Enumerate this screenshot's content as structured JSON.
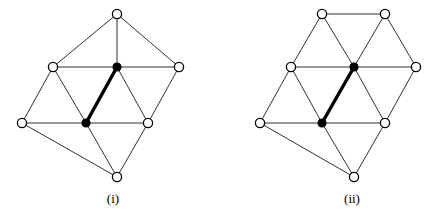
{
  "figure": {
    "title": "",
    "background_color": "#ffffff",
    "edge_color": "#1a1a1a",
    "bold_edge_color": "#000000",
    "vertex_open_fill": "#ffffff",
    "vertex_filled_fill": "#000000",
    "panels": [
      {
        "id": "panel-i",
        "caption": "(i)",
        "caption_x": 113,
        "caption_y": 203,
        "vertices": [
          {
            "id": "v-top",
            "x": 117,
            "y": 14,
            "type": "open"
          },
          {
            "id": "v-mid-left",
            "x": 53,
            "y": 67,
            "type": "open"
          },
          {
            "id": "v-mid-center",
            "x": 117,
            "y": 67,
            "type": "filled"
          },
          {
            "id": "v-mid-right",
            "x": 179,
            "y": 67,
            "type": "open"
          },
          {
            "id": "v-low-left",
            "x": 22,
            "y": 123,
            "type": "open"
          },
          {
            "id": "v-low-center",
            "x": 86,
            "y": 123,
            "type": "filled"
          },
          {
            "id": "v-low-right",
            "x": 148,
            "y": 123,
            "type": "open"
          },
          {
            "id": "v-bottom",
            "x": 117,
            "y": 177,
            "type": "open"
          }
        ],
        "edges": [
          {
            "from": "v-top",
            "to": "v-mid-left",
            "weight": "thin"
          },
          {
            "from": "v-top",
            "to": "v-mid-center",
            "weight": "thin"
          },
          {
            "from": "v-top",
            "to": "v-mid-right",
            "weight": "thin"
          },
          {
            "from": "v-mid-left",
            "to": "v-mid-center",
            "weight": "thin"
          },
          {
            "from": "v-mid-center",
            "to": "v-mid-right",
            "weight": "thin"
          },
          {
            "from": "v-mid-left",
            "to": "v-low-left",
            "weight": "thin"
          },
          {
            "from": "v-mid-left",
            "to": "v-low-center",
            "weight": "thin"
          },
          {
            "from": "v-mid-center",
            "to": "v-low-center",
            "weight": "bold"
          },
          {
            "from": "v-mid-center",
            "to": "v-low-right",
            "weight": "thin"
          },
          {
            "from": "v-mid-right",
            "to": "v-low-right",
            "weight": "thin"
          },
          {
            "from": "v-low-left",
            "to": "v-low-center",
            "weight": "thin"
          },
          {
            "from": "v-low-center",
            "to": "v-low-right",
            "weight": "thin"
          },
          {
            "from": "v-low-left",
            "to": "v-bottom",
            "weight": "thin"
          },
          {
            "from": "v-low-center",
            "to": "v-bottom",
            "weight": "thin"
          },
          {
            "from": "v-low-right",
            "to": "v-bottom",
            "weight": "thin"
          }
        ]
      },
      {
        "id": "panel-ii",
        "caption": "(ii)",
        "caption_x": 352,
        "caption_y": 203,
        "vertices": [
          {
            "id": "w-top-left",
            "x": 322,
            "y": 14,
            "type": "open"
          },
          {
            "id": "w-top-right",
            "x": 385,
            "y": 14,
            "type": "open"
          },
          {
            "id": "w-mid-left",
            "x": 291,
            "y": 67,
            "type": "open"
          },
          {
            "id": "w-mid-center",
            "x": 354,
            "y": 67,
            "type": "filled"
          },
          {
            "id": "w-mid-right",
            "x": 416,
            "y": 67,
            "type": "open"
          },
          {
            "id": "w-low-left",
            "x": 260,
            "y": 123,
            "type": "open"
          },
          {
            "id": "w-low-center",
            "x": 322,
            "y": 123,
            "type": "filled"
          },
          {
            "id": "w-low-right",
            "x": 385,
            "y": 123,
            "type": "open"
          },
          {
            "id": "w-bottom",
            "x": 354,
            "y": 177,
            "type": "open"
          }
        ],
        "edges": [
          {
            "from": "w-top-left",
            "to": "w-top-right",
            "weight": "thin"
          },
          {
            "from": "w-top-left",
            "to": "w-mid-left",
            "weight": "thin"
          },
          {
            "from": "w-top-left",
            "to": "w-mid-center",
            "weight": "thin"
          },
          {
            "from": "w-top-right",
            "to": "w-mid-center",
            "weight": "thin"
          },
          {
            "from": "w-top-right",
            "to": "w-mid-right",
            "weight": "thin"
          },
          {
            "from": "w-mid-left",
            "to": "w-mid-center",
            "weight": "thin"
          },
          {
            "from": "w-mid-center",
            "to": "w-mid-right",
            "weight": "thin"
          },
          {
            "from": "w-mid-left",
            "to": "w-low-left",
            "weight": "thin"
          },
          {
            "from": "w-mid-left",
            "to": "w-low-center",
            "weight": "thin"
          },
          {
            "from": "w-mid-center",
            "to": "w-low-center",
            "weight": "bold"
          },
          {
            "from": "w-mid-center",
            "to": "w-low-right",
            "weight": "thin"
          },
          {
            "from": "w-mid-right",
            "to": "w-low-right",
            "weight": "thin"
          },
          {
            "from": "w-low-left",
            "to": "w-low-center",
            "weight": "thin"
          },
          {
            "from": "w-low-center",
            "to": "w-low-right",
            "weight": "thin"
          },
          {
            "from": "w-low-left",
            "to": "w-bottom",
            "weight": "thin"
          },
          {
            "from": "w-low-center",
            "to": "w-bottom",
            "weight": "thin"
          },
          {
            "from": "w-low-right",
            "to": "w-bottom",
            "weight": "thin"
          }
        ]
      }
    ],
    "vertex_radius_open": 4.6,
    "vertex_radius_filled": 4.0
  }
}
